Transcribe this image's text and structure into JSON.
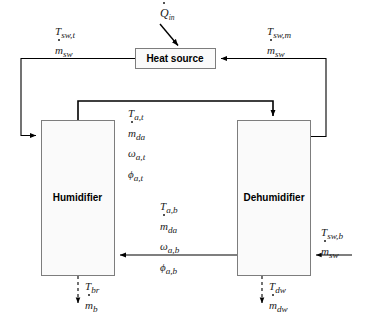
{
  "diagram": {
    "components": {
      "heat_source": {
        "label": "Heat source"
      },
      "humidifier": {
        "label": "Humidifier"
      },
      "dehumidifier": {
        "label": "Dehumidifier"
      }
    },
    "labels": {
      "heat_input": {
        "symbol": "Q",
        "sub": "in",
        "dotted": true
      },
      "seawater_top_left": {
        "line1_symbol": "T",
        "line1_sub": "sw,t",
        "line2_symbol": "m",
        "line2_sub": "sw",
        "line2_dotted": true
      },
      "seawater_top_right": {
        "line1_symbol": "T",
        "line1_sub": "sw,m",
        "line2_symbol": "m",
        "line2_sub": "sw",
        "line2_dotted": true
      },
      "air_top": {
        "line1_symbol": "T",
        "line1_sub": "a,t",
        "line2_symbol": "m",
        "line2_sub": "da",
        "line2_dotted": true,
        "line3_symbol": "ω",
        "line3_sub": "a,t",
        "line4_symbol": "ϕ",
        "line4_sub": "a,t"
      },
      "air_bottom": {
        "line1_symbol": "T",
        "line1_sub": "a,b",
        "line2_symbol": "m",
        "line2_sub": "da",
        "line2_dotted": true,
        "line3_symbol": "ω",
        "line3_sub": "a,b",
        "line4_symbol": "ϕ",
        "line4_sub": "a,b"
      },
      "seawater_bottom_right": {
        "line1_symbol": "T",
        "line1_sub": "sw,b",
        "line2_symbol": "m",
        "line2_sub": "sw",
        "line2_dotted": true
      },
      "brine_outlet": {
        "line1_symbol": "T",
        "line1_sub": "br",
        "line2_symbol": "m",
        "line2_sub": "b",
        "line2_dotted": true
      },
      "distillate_outlet": {
        "line1_symbol": "T",
        "line1_sub": "dw",
        "line2_symbol": "m",
        "line2_sub": "dw",
        "line2_dotted": true
      }
    },
    "colors": {
      "line": "#000000",
      "box_stroke": "#8c8c8c",
      "box_fill": "#fafafa",
      "text": "#1a1a1a"
    }
  }
}
